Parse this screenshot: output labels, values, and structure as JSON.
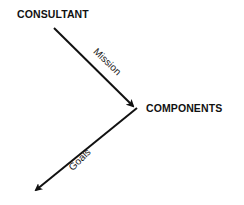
{
  "diagram": {
    "nodes": [
      {
        "id": "consultant",
        "label": "CONSULTANT"
      },
      {
        "id": "components",
        "label": "COMPONENTS"
      }
    ],
    "edges": [
      {
        "id": "mission",
        "from": "consultant",
        "to": "components",
        "label": "Mission"
      },
      {
        "id": "goals",
        "from": "components",
        "to": "outward",
        "label": "Goals"
      }
    ],
    "colors": {
      "line": "#111111",
      "text": "#111111",
      "background": "#ffffff"
    }
  }
}
